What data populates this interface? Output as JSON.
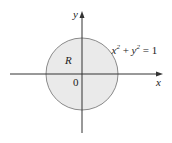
{
  "diagram": {
    "equation": {
      "base_x": "x",
      "exp_x": "2",
      "plus": " + ",
      "base_y": "y",
      "exp_y": "2",
      "rhs": " = 1"
    },
    "region_label": "R",
    "origin_label": "0",
    "x_axis_label": "x",
    "y_axis_label": "y",
    "colors": {
      "fill": "#eaeaea",
      "stroke": "#8a8a8a",
      "axis": "#333333"
    }
  }
}
